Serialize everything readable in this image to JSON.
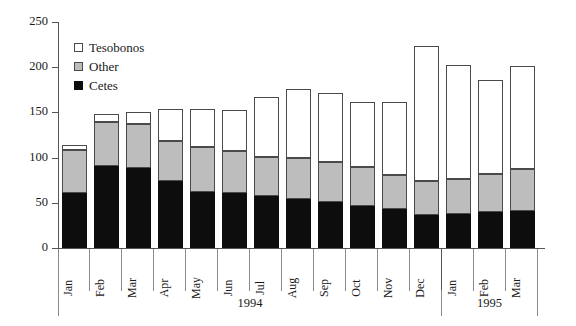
{
  "chart_data": {
    "type": "bar",
    "stacked": true,
    "title": "",
    "subtitle": "",
    "xlabel": "",
    "ylabel": "",
    "ylim": [
      0,
      250
    ],
    "yticks": [
      0,
      50,
      100,
      150,
      200,
      250
    ],
    "ytick_labels": [
      "0",
      "50",
      "100",
      "150",
      "200",
      "250"
    ],
    "grid": false,
    "legend_position": "upper-left-inside",
    "categories": [
      "Jan",
      "Feb",
      "Mar",
      "Apr",
      "May",
      "Jun",
      "Jul",
      "Aug",
      "Sep",
      "Oct",
      "Nov",
      "Dec",
      "Jan",
      "Feb",
      "Mar"
    ],
    "group_labels": [
      {
        "label": "1994",
        "start_index": 0,
        "span": 12
      },
      {
        "label": "1995",
        "start_index": 12,
        "span": 3
      }
    ],
    "series": [
      {
        "name": "Cetes",
        "color": "#0d0d0d",
        "values": [
          61,
          91,
          89,
          74,
          62,
          61,
          58,
          54,
          51,
          47,
          43,
          37,
          38,
          40,
          41
        ]
      },
      {
        "name": "Other",
        "color": "#bdbdbd",
        "values": [
          47,
          48,
          48,
          44,
          50,
          46,
          43,
          46,
          44,
          43,
          38,
          37,
          38,
          42,
          46
        ]
      },
      {
        "name": "Tesobonos",
        "color": "#ffffff",
        "values": [
          6,
          9,
          13,
          36,
          42,
          46,
          66,
          76,
          77,
          71,
          81,
          149,
          126,
          104,
          114
        ]
      }
    ],
    "totals": [
      114,
      148,
      150,
      154,
      154,
      153,
      167,
      176,
      172,
      161,
      162,
      223,
      202,
      186,
      201
    ],
    "cumulative_cetes": [
      61,
      91,
      89,
      74,
      62,
      61,
      58,
      54,
      51,
      47,
      43,
      37,
      38,
      40,
      41
    ],
    "cumulative_other": [
      108,
      139,
      137,
      118,
      112,
      107,
      101,
      100,
      95,
      90,
      81,
      74,
      76,
      82,
      87
    ]
  },
  "legend": {
    "items": [
      {
        "label": "Tesobonos",
        "swatch": "white-square-outline"
      },
      {
        "label": "Other",
        "swatch": "gray-square"
      },
      {
        "label": "Cetes",
        "swatch": "black-square"
      }
    ]
  },
  "colors": {
    "cetes": "#0d0d0d",
    "other": "#bdbdbd",
    "tesobonos": "#ffffff",
    "outline": "#4a4a4a",
    "axis": "#555555"
  }
}
